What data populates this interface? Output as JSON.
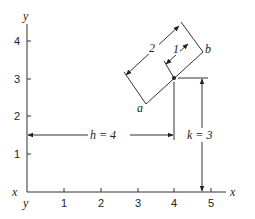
{
  "diagram": {
    "axes": {
      "x_label": "x",
      "y_label": "y",
      "origin_x_label": "x",
      "origin_y_label": "y",
      "x_ticks": [
        "1",
        "2",
        "3",
        "4",
        "5"
      ],
      "y_ticks": [
        "1",
        "2",
        "3",
        "4"
      ]
    },
    "point": {
      "x": 4,
      "y": 3
    },
    "dimensions": {
      "h_label": "h = 4",
      "k_label": "k = 3",
      "len_2_label": "2",
      "len_1_label": "1"
    },
    "segment_endpoints": {
      "a": "a",
      "b": "b"
    }
  }
}
